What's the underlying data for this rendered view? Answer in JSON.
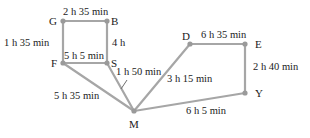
{
  "diagram": {
    "type": "weighted-graph",
    "nodes": [
      {
        "id": "G",
        "label": "G",
        "x": 63,
        "y": 21
      },
      {
        "id": "B",
        "label": "B",
        "x": 107,
        "y": 21
      },
      {
        "id": "F",
        "label": "F",
        "x": 63,
        "y": 63
      },
      {
        "id": "S",
        "label": "S",
        "x": 107,
        "y": 63
      },
      {
        "id": "D",
        "label": "D",
        "x": 190,
        "y": 44
      },
      {
        "id": "E",
        "label": "E",
        "x": 245,
        "y": 44
      },
      {
        "id": "Y",
        "label": "Y",
        "x": 250,
        "y": 93
      },
      {
        "id": "M",
        "label": "M",
        "x": 134,
        "y": 111
      }
    ],
    "edges": [
      {
        "from": "G",
        "to": "B",
        "label": "2 h 35 min"
      },
      {
        "from": "G",
        "to": "F",
        "label": "1 h 35 min"
      },
      {
        "from": "B",
        "to": "S",
        "label": "4 h"
      },
      {
        "from": "F",
        "to": "S",
        "label": "5 h 5 min"
      },
      {
        "from": "F",
        "to": "M",
        "label": "5 h 35 min"
      },
      {
        "from": "S",
        "to": "M",
        "label": "1 h 50 min"
      },
      {
        "from": "D",
        "to": "M",
        "label": "3 h 15 min"
      },
      {
        "from": "D",
        "to": "E",
        "label": "6 h 35 min"
      },
      {
        "from": "E",
        "to": "Y",
        "label": "2 h 40 min"
      },
      {
        "from": "M",
        "to": "Y",
        "label": "6 h 5 min"
      }
    ]
  }
}
